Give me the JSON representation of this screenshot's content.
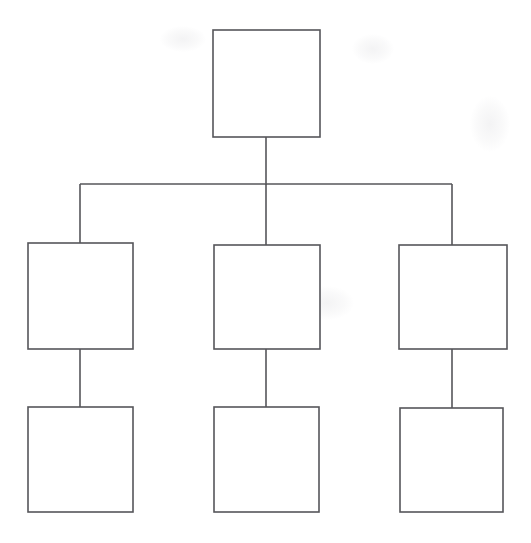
{
  "diagram": {
    "type": "tree",
    "orientation": "top-down",
    "canvas": {
      "width": 531,
      "height": 543,
      "background": "#ffffff"
    },
    "style": {
      "line_color": "#56565a",
      "line_width": 1.6,
      "box_fill": "#ffffff"
    },
    "nodes": [
      {
        "id": "root",
        "label": "",
        "level": 0,
        "column": "center",
        "x": 213,
        "y": 30,
        "width": 107,
        "height": 107
      },
      {
        "id": "child-left",
        "label": "",
        "level": 1,
        "column": "left",
        "x": 28,
        "y": 243,
        "width": 105,
        "height": 106
      },
      {
        "id": "child-center",
        "label": "",
        "level": 1,
        "column": "center",
        "x": 214,
        "y": 245,
        "width": 106,
        "height": 104
      },
      {
        "id": "child-right",
        "label": "",
        "level": 1,
        "column": "right",
        "x": 399,
        "y": 245,
        "width": 108,
        "height": 104
      },
      {
        "id": "leaf-left",
        "label": "",
        "level": 2,
        "column": "left",
        "x": 28,
        "y": 407,
        "width": 105,
        "height": 105
      },
      {
        "id": "leaf-center",
        "label": "",
        "level": 2,
        "column": "center",
        "x": 214,
        "y": 407,
        "width": 105,
        "height": 105
      },
      {
        "id": "leaf-right",
        "label": "",
        "level": 2,
        "column": "right",
        "x": 400,
        "y": 408,
        "width": 103,
        "height": 104
      }
    ],
    "edges": [
      {
        "id": "edge-root-bus",
        "from": "root",
        "to": "bus",
        "kind": "vertical",
        "x1": 266,
        "y1": 137,
        "x2": 266,
        "y2": 185
      },
      {
        "id": "edge-bus",
        "from": "bus",
        "to": "bus",
        "kind": "horizontal",
        "x1": 80,
        "y1": 184,
        "x2": 452,
        "y2": 184
      },
      {
        "id": "edge-bus-child-left",
        "from": "bus",
        "to": "child-left",
        "kind": "vertical",
        "x1": 80,
        "y1": 184,
        "x2": 80,
        "y2": 243
      },
      {
        "id": "edge-bus-child-center",
        "from": "bus",
        "to": "child-center",
        "kind": "vertical",
        "x1": 266,
        "y1": 184,
        "x2": 266,
        "y2": 245
      },
      {
        "id": "edge-bus-child-right",
        "from": "bus",
        "to": "child-right",
        "kind": "vertical",
        "x1": 452,
        "y1": 184,
        "x2": 452,
        "y2": 245
      },
      {
        "id": "edge-child-leaf-left",
        "from": "child-left",
        "to": "leaf-left",
        "kind": "vertical",
        "x1": 80,
        "y1": 349,
        "x2": 80,
        "y2": 407
      },
      {
        "id": "edge-child-leaf-center",
        "from": "child-center",
        "to": "leaf-center",
        "kind": "vertical",
        "x1": 266,
        "y1": 349,
        "x2": 266,
        "y2": 407
      },
      {
        "id": "edge-child-leaf-right",
        "from": "child-right",
        "to": "leaf-right",
        "kind": "vertical",
        "x1": 452,
        "y1": 349,
        "x2": 452,
        "y2": 408
      }
    ],
    "artifacts": [
      {
        "id": "smudge-top-left",
        "kind": "scan-smudge"
      },
      {
        "id": "smudge-top-right",
        "kind": "scan-smudge"
      },
      {
        "id": "smudge-right-mid",
        "kind": "scan-smudge"
      },
      {
        "id": "smudge-lower",
        "kind": "scan-smudge"
      }
    ]
  }
}
